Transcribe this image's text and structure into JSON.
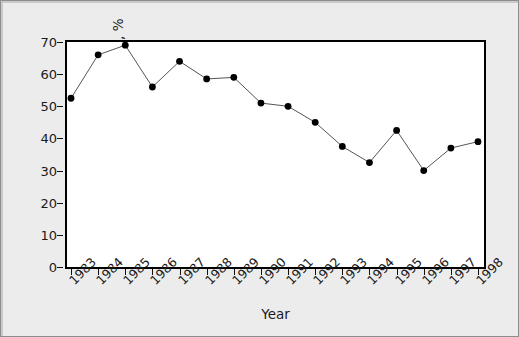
{
  "chart_data": {
    "type": "line",
    "title": "",
    "xlabel": "Year",
    "ylabel": "Dying patients with ARDS, %",
    "categories": [
      "1983",
      "1984",
      "1985",
      "1986",
      "1987",
      "1988",
      "1989",
      "1990",
      "1991",
      "1992",
      "1993",
      "1994",
      "1995",
      "1996",
      "1997",
      "1998"
    ],
    "values": [
      52.5,
      66,
      69,
      56,
      64,
      58.5,
      59,
      51,
      50,
      45,
      37.5,
      32.5,
      42.5,
      30,
      37,
      39
    ],
    "series": [
      {
        "name": "Dying patients with ARDS",
        "values": [
          52.5,
          66,
          69,
          56,
          64,
          58.5,
          59,
          51,
          50,
          45,
          37.5,
          32.5,
          42.5,
          30,
          37,
          39
        ]
      }
    ],
    "xlim": [
      1982.5,
      1998.5
    ],
    "ylim": [
      0,
      73
    ],
    "yticks": [
      0,
      10,
      20,
      30,
      40,
      50,
      60,
      70
    ],
    "ytick_labels": [
      "0",
      "10",
      "20",
      "30",
      "40",
      "50",
      "60",
      "70"
    ],
    "xticks": [
      "1983",
      "1984",
      "1985",
      "1986",
      "1987",
      "1988",
      "1989",
      "1990",
      "1991",
      "1992",
      "1993",
      "1994",
      "1995",
      "1996",
      "1997",
      "1998"
    ],
    "grid": false,
    "legend": "none",
    "marker": "filled-circle",
    "line_color": "#555555",
    "marker_color": "#000000",
    "plot_background": "#ffffff",
    "figure_background": "#ececec",
    "axis_color": "#000000"
  }
}
